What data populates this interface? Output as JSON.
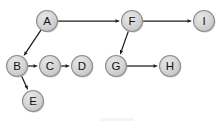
{
  "diagram": {
    "type": "directed-graph",
    "canvas": {
      "width": 221,
      "height": 127,
      "background": "#ffffff"
    },
    "style": {
      "node_fill": "#d4d4d4",
      "node_fill_light": "#e2e2e2",
      "node_stroke": "#8d8d8d",
      "node_radius": 10.5,
      "label_color": "#111111",
      "edge_color": "#1a1a1a"
    },
    "nodes": [
      {
        "id": "A",
        "label": "A",
        "x": 47,
        "y": 21
      },
      {
        "id": "B",
        "label": "B",
        "x": 17,
        "y": 66
      },
      {
        "id": "C",
        "label": "C",
        "x": 50,
        "y": 66
      },
      {
        "id": "D",
        "label": "D",
        "x": 82,
        "y": 66
      },
      {
        "id": "E",
        "label": "E",
        "x": 33,
        "y": 101
      },
      {
        "id": "F",
        "label": "F",
        "x": 132,
        "y": 21
      },
      {
        "id": "G",
        "label": "G",
        "x": 116,
        "y": 66
      },
      {
        "id": "H",
        "label": "H",
        "x": 170,
        "y": 66
      },
      {
        "id": "I",
        "label": "I",
        "x": 204,
        "y": 21
      }
    ],
    "edges": [
      {
        "from": "A",
        "to": "F",
        "label": ""
      },
      {
        "from": "A",
        "to": "B",
        "label": ""
      },
      {
        "from": "B",
        "to": "C",
        "label": ""
      },
      {
        "from": "B",
        "to": "E",
        "label": ""
      },
      {
        "from": "C",
        "to": "D",
        "label": ""
      },
      {
        "from": "F",
        "to": "I",
        "label": ""
      },
      {
        "from": "F",
        "to": "G",
        "label": ""
      },
      {
        "from": "G",
        "to": "H",
        "label": ""
      }
    ]
  }
}
